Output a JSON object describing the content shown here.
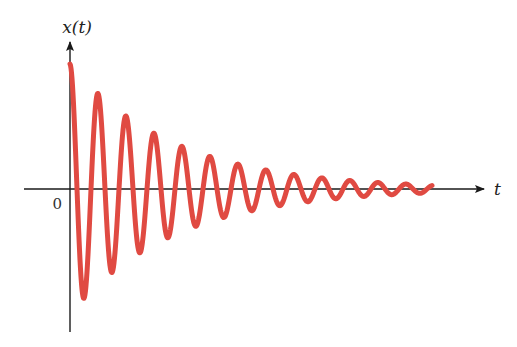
{
  "chart_data": {
    "type": "line",
    "title": "",
    "xlabel": "t",
    "ylabel": "x(t)",
    "origin_label": "0",
    "grid": false,
    "legend": null,
    "series": [
      {
        "name": "x(t)",
        "color": "#e04a42",
        "function": "damped_cosine",
        "amplitude": 1.0,
        "decay_rate_per_period": 0.27,
        "period": 1.0,
        "t_range": [
          0,
          12.95
        ],
        "peak_amplitudes": [
          1.0,
          0.77,
          0.59,
          0.46,
          0.35,
          0.26,
          0.2,
          0.15,
          0.11,
          0.09,
          0.07,
          0.05,
          0.04
        ],
        "trough_amplitudes": [
          -0.92,
          -0.7,
          -0.55,
          -0.42,
          -0.32,
          -0.25,
          -0.18,
          -0.14,
          -0.11,
          -0.08,
          -0.06,
          -0.05
        ]
      }
    ],
    "axes": {
      "x_arrow": true,
      "y_arrow": true,
      "axis_color": "#1a1a1a"
    }
  },
  "layout_px": {
    "origin_x": 70,
    "origin_y": 189,
    "x_axis_start": 24,
    "x_axis_end": 484,
    "y_axis_top": 42,
    "y_axis_bottom": 332,
    "period_px": 28,
    "amplitude_px": 125,
    "decay_per_px": 0.0096,
    "curve_end_x": 432
  }
}
